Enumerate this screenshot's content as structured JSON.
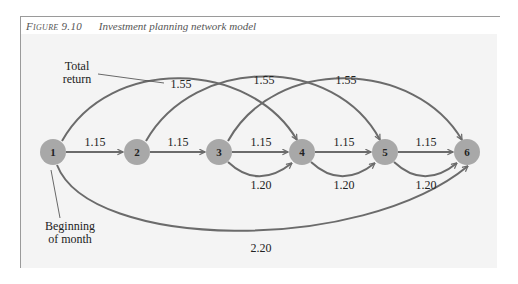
{
  "caption": {
    "figure_label": "Figure 9.10",
    "title": "Investment planning network model"
  },
  "annotations": {
    "total_return_line1": "Total",
    "total_return_line2": "return",
    "beginning_line1": "Beginning",
    "beginning_line2": "of month"
  },
  "nodes": [
    {
      "id": "1",
      "label": "1"
    },
    {
      "id": "2",
      "label": "2"
    },
    {
      "id": "3",
      "label": "3"
    },
    {
      "id": "4",
      "label": "4"
    },
    {
      "id": "5",
      "label": "5"
    },
    {
      "id": "6",
      "label": "6"
    }
  ],
  "edges": [
    {
      "from": "1",
      "to": "2",
      "weight": "1.15",
      "type": "straight"
    },
    {
      "from": "2",
      "to": "3",
      "weight": "1.15",
      "type": "straight"
    },
    {
      "from": "3",
      "to": "4",
      "weight": "1.15",
      "type": "straight"
    },
    {
      "from": "4",
      "to": "5",
      "weight": "1.15",
      "type": "straight"
    },
    {
      "from": "5",
      "to": "6",
      "weight": "1.15",
      "type": "straight"
    },
    {
      "from": "3",
      "to": "4",
      "weight": "1.20",
      "type": "lower-arc"
    },
    {
      "from": "4",
      "to": "5",
      "weight": "1.20",
      "type": "lower-arc"
    },
    {
      "from": "5",
      "to": "6",
      "weight": "1.20",
      "type": "lower-arc"
    },
    {
      "from": "1",
      "to": "4",
      "weight": "1.55",
      "type": "upper-arc"
    },
    {
      "from": "2",
      "to": "5",
      "weight": "1.55",
      "type": "upper-arc"
    },
    {
      "from": "3",
      "to": "6",
      "weight": "1.55",
      "type": "upper-arc"
    },
    {
      "from": "1",
      "to": "6",
      "weight": "2.20",
      "type": "bottom-arc"
    }
  ],
  "colors": {
    "node_fill": "#a8a8a8",
    "edge_stroke": "#6b6b6b",
    "panel_bg": "#f4f4f4"
  }
}
